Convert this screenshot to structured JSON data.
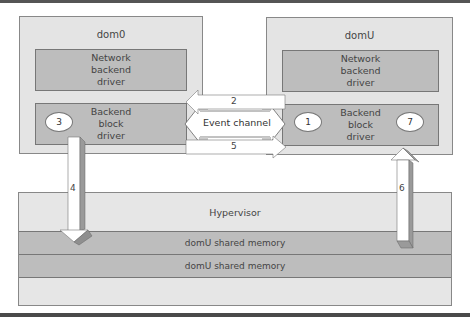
{
  "diagram": {
    "dom0": {
      "title": "dom0",
      "network_driver": [
        "Network",
        "backend",
        "driver"
      ],
      "block_driver": [
        "Backend",
        "block",
        "driver"
      ],
      "badge": "3"
    },
    "domU": {
      "title": "domU",
      "network_driver": [
        "Network",
        "backend",
        "driver"
      ],
      "block_driver": [
        "Backend",
        "block",
        "driver"
      ],
      "badge_left": "1",
      "badge_right": "7"
    },
    "event_channel": {
      "label": "Event channel",
      "step_top": "2",
      "step_bottom": "5"
    },
    "hypervisor": {
      "title": "Hypervisor",
      "memory_rows": [
        "domU shared memory",
        "domU shared memory"
      ]
    },
    "steps": {
      "down_arrow": "4",
      "up_arrow": "6"
    },
    "colors": {
      "outer_box": "#e4e4e4",
      "driver_box": "#bdbdbd",
      "border": "#777777"
    }
  }
}
